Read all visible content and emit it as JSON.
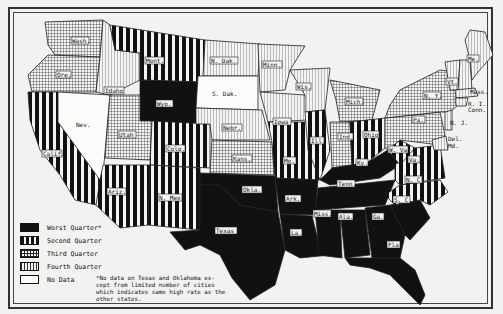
{
  "map": {
    "title": "",
    "categories": {
      "worst": {
        "label": "Worst Quarter*",
        "pattern": "solid-black"
      },
      "second": {
        "label": "Second Quarter",
        "pattern": "bold-vertical-stripes"
      },
      "third": {
        "label": "Third Quarter",
        "pattern": "grid-crosshatch"
      },
      "fourth": {
        "label": "Fourth Quarter",
        "pattern": "fine-vertical-lines"
      },
      "nodata": {
        "label": "No Data",
        "pattern": "white"
      }
    },
    "states": [
      {
        "abbr": "Wash.",
        "category": "third"
      },
      {
        "abbr": "Ore.",
        "category": "third"
      },
      {
        "abbr": "Calif.",
        "category": "second"
      },
      {
        "abbr": "Nev.",
        "category": "nodata"
      },
      {
        "abbr": "Idaho",
        "category": "fourth"
      },
      {
        "abbr": "Mont.",
        "category": "second"
      },
      {
        "abbr": "Wyo.",
        "category": "worst"
      },
      {
        "abbr": "Utah",
        "category": "third"
      },
      {
        "abbr": "Colo.",
        "category": "second"
      },
      {
        "abbr": "Ariz.",
        "category": "second"
      },
      {
        "abbr": "N. Mex.",
        "category": "second"
      },
      {
        "abbr": "N. Dak.",
        "category": "fourth"
      },
      {
        "abbr": "S. Dak.",
        "category": "nodata"
      },
      {
        "abbr": "Nebr.",
        "category": "fourth"
      },
      {
        "abbr": "Kans.",
        "category": "third"
      },
      {
        "abbr": "Okla.",
        "category": "worst"
      },
      {
        "abbr": "Texas",
        "category": "worst"
      },
      {
        "abbr": "Minn.",
        "category": "fourth"
      },
      {
        "abbr": "Iowa",
        "category": "fourth"
      },
      {
        "abbr": "Mo.",
        "category": "second"
      },
      {
        "abbr": "Ark.",
        "category": "worst"
      },
      {
        "abbr": "La.",
        "category": "worst"
      },
      {
        "abbr": "Wis.",
        "category": "fourth"
      },
      {
        "abbr": "Ill.",
        "category": "second"
      },
      {
        "abbr": "Mich.",
        "category": "third"
      },
      {
        "abbr": "Ind.",
        "category": "third"
      },
      {
        "abbr": "Ohio",
        "category": "second"
      },
      {
        "abbr": "Ky.",
        "category": "worst"
      },
      {
        "abbr": "Tenn.",
        "category": "worst"
      },
      {
        "abbr": "Miss.",
        "category": "worst"
      },
      {
        "abbr": "Ala.",
        "category": "worst"
      },
      {
        "abbr": "Ga.",
        "category": "worst"
      },
      {
        "abbr": "Fla.",
        "category": "worst"
      },
      {
        "abbr": "S. C.",
        "category": "worst"
      },
      {
        "abbr": "N. C.",
        "category": "second"
      },
      {
        "abbr": "Va.",
        "category": "second"
      },
      {
        "abbr": "W. Va.",
        "category": "second"
      },
      {
        "abbr": "Pa.",
        "category": "third"
      },
      {
        "abbr": "N. Y.",
        "category": "third"
      },
      {
        "abbr": "Vt.",
        "category": "fourth"
      },
      {
        "abbr": "N. H.",
        "category": "fourth"
      },
      {
        "abbr": "Me.",
        "category": "fourth"
      },
      {
        "abbr": "Mass.",
        "category": "fourth"
      },
      {
        "abbr": "R. I.",
        "category": "fourth"
      },
      {
        "abbr": "Conn.",
        "category": "fourth"
      },
      {
        "abbr": "N. J.",
        "category": "fourth"
      },
      {
        "abbr": "Del.",
        "category": "fourth"
      },
      {
        "abbr": "Md.",
        "category": "fourth"
      }
    ],
    "outside_labels": {
      "mass": "Mass.",
      "ri": "R. I.",
      "conn": "Conn.",
      "nj": "N. J.",
      "del": "Del.",
      "md": "Md."
    },
    "footnote": "*No data on Texas and Oklahoma ex-cept from limited number of cities which indicates same high rate as the other states."
  },
  "legend": {
    "items": [
      {
        "label": "Worst Quarter*"
      },
      {
        "label": "Second Quarter"
      },
      {
        "label": "Third Quarter"
      },
      {
        "label": "Fourth Quarter"
      },
      {
        "label": "No Data"
      }
    ]
  },
  "colors": {
    "ink": "#111111",
    "paper": "#f2f2f0"
  }
}
